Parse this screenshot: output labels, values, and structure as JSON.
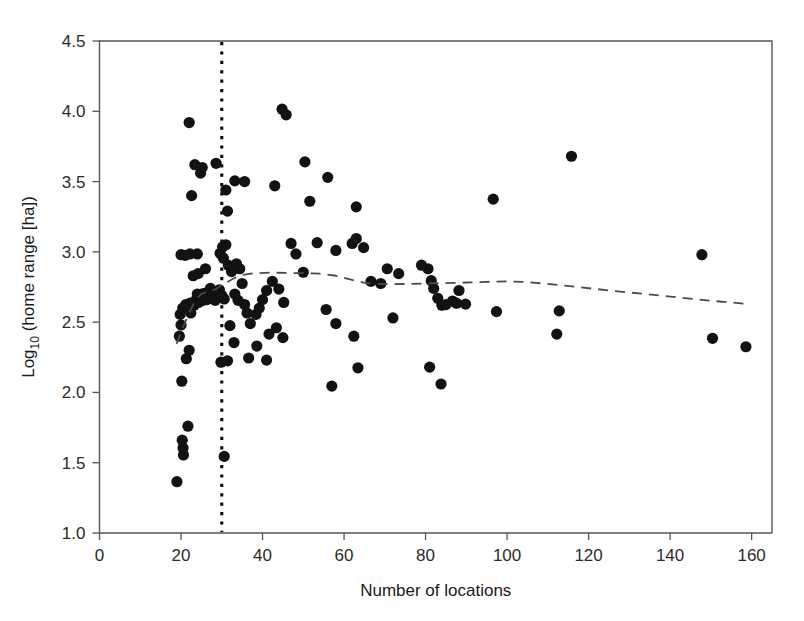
{
  "chart_data": {
    "type": "scatter",
    "title": "",
    "xlabel": "Number of locations",
    "ylabel_main": "Log",
    "ylabel_sub": "10",
    "ylabel_rest": " (home range [ha])",
    "ylabel_full": "Log10 (home range [ha])",
    "xlim": [
      0,
      165
    ],
    "ylim": [
      1.0,
      4.5
    ],
    "xticks": [
      0,
      20,
      40,
      60,
      80,
      100,
      120,
      140,
      160
    ],
    "xtick_labels": [
      "0",
      "20",
      "40",
      "60",
      "80",
      "100",
      "120",
      "140",
      "160"
    ],
    "yticks": [
      1.0,
      1.5,
      2.0,
      2.5,
      3.0,
      3.5,
      4.0,
      4.5
    ],
    "ytick_labels": [
      "1.0",
      "1.5",
      "2.0",
      "2.5",
      "3.0",
      "3.5",
      "4.0",
      "4.5"
    ],
    "grid": false,
    "legend": "none",
    "marker_color": "#121212",
    "marker_radius": 5.6,
    "annotations": [
      {
        "name": "threshold-line",
        "type": "vertical-dotted-line",
        "x": 30,
        "color": "#0d0d0d",
        "style": "dotted"
      },
      {
        "name": "trend-line",
        "type": "dashed-smoother",
        "color": "#4a4a4a",
        "style": "dashed"
      }
    ],
    "trend_points": [
      [
        18.9,
        2.345
      ],
      [
        20.0,
        2.425
      ],
      [
        21.0,
        2.5
      ],
      [
        22.0,
        2.565
      ],
      [
        23.0,
        2.625
      ],
      [
        24.0,
        2.672
      ],
      [
        25.0,
        2.7
      ],
      [
        26.0,
        2.712
      ],
      [
        27.0,
        2.718
      ],
      [
        28.5,
        2.735
      ],
      [
        30.0,
        2.762
      ],
      [
        31.5,
        2.788
      ],
      [
        33.0,
        2.812
      ],
      [
        35.0,
        2.835
      ],
      [
        38.0,
        2.848
      ],
      [
        42.0,
        2.852
      ],
      [
        46.0,
        2.85
      ],
      [
        50.0,
        2.848
      ],
      [
        54.0,
        2.845
      ],
      [
        58.0,
        2.83
      ],
      [
        62.0,
        2.8
      ],
      [
        65.0,
        2.78
      ],
      [
        68.0,
        2.772
      ],
      [
        72.0,
        2.77
      ],
      [
        76.0,
        2.772
      ],
      [
        80.0,
        2.775
      ],
      [
        85.0,
        2.778
      ],
      [
        90.0,
        2.782
      ],
      [
        95.0,
        2.787
      ],
      [
        100.0,
        2.79
      ],
      [
        105.0,
        2.785
      ],
      [
        110.0,
        2.772
      ],
      [
        118.0,
        2.748
      ],
      [
        126.0,
        2.722
      ],
      [
        134.0,
        2.7
      ],
      [
        142.0,
        2.676
      ],
      [
        150.0,
        2.652
      ],
      [
        158.0,
        2.632
      ]
    ],
    "points": [
      [
        19.0,
        1.365
      ],
      [
        20.5,
        1.605
      ],
      [
        20.3,
        1.66
      ],
      [
        21.7,
        1.76
      ],
      [
        20.6,
        1.555
      ],
      [
        30.6,
        1.545
      ],
      [
        20.2,
        2.08
      ],
      [
        21.3,
        2.24
      ],
      [
        22.0,
        2.3
      ],
      [
        19.6,
        2.4
      ],
      [
        20.0,
        2.48
      ],
      [
        19.8,
        2.555
      ],
      [
        20.4,
        2.6
      ],
      [
        21.2,
        2.625
      ],
      [
        22.2,
        2.635
      ],
      [
        22.4,
        2.565
      ],
      [
        23.2,
        2.62
      ],
      [
        23.6,
        2.655
      ],
      [
        24.0,
        2.7
      ],
      [
        24.3,
        2.64
      ],
      [
        25.0,
        2.7
      ],
      [
        25.4,
        2.655
      ],
      [
        25.8,
        2.705
      ],
      [
        26.4,
        2.66
      ],
      [
        26.8,
        2.695
      ],
      [
        27.2,
        2.74
      ],
      [
        27.8,
        2.69
      ],
      [
        28.4,
        2.655
      ],
      [
        28.8,
        2.7
      ],
      [
        29.4,
        2.73
      ],
      [
        30.0,
        2.69
      ],
      [
        30.6,
        2.665
      ],
      [
        23.0,
        2.83
      ],
      [
        24.2,
        2.845
      ],
      [
        26.0,
        2.88
      ],
      [
        29.6,
        2.99
      ],
      [
        30.2,
        3.035
      ],
      [
        30.4,
        2.955
      ],
      [
        31.0,
        3.05
      ],
      [
        31.6,
        2.905
      ],
      [
        32.4,
        2.86
      ],
      [
        33.6,
        2.915
      ],
      [
        34.4,
        2.88
      ],
      [
        35.0,
        2.775
      ],
      [
        33.2,
        2.7
      ],
      [
        34.0,
        2.655
      ],
      [
        35.6,
        2.625
      ],
      [
        36.2,
        2.565
      ],
      [
        37.0,
        2.49
      ],
      [
        32.0,
        2.475
      ],
      [
        33.0,
        2.355
      ],
      [
        31.4,
        2.225
      ],
      [
        29.8,
        2.215
      ],
      [
        36.6,
        2.245
      ],
      [
        38.4,
        2.555
      ],
      [
        39.2,
        2.6
      ],
      [
        40.0,
        2.66
      ],
      [
        41.0,
        2.725
      ],
      [
        42.4,
        2.79
      ],
      [
        44.0,
        2.735
      ],
      [
        45.2,
        2.64
      ],
      [
        43.4,
        2.46
      ],
      [
        41.6,
        2.415
      ],
      [
        45.0,
        2.39
      ],
      [
        38.6,
        2.33
      ],
      [
        41.0,
        2.23
      ],
      [
        22.2,
        2.985
      ],
      [
        24.0,
        2.985
      ],
      [
        20.0,
        2.98
      ],
      [
        21.0,
        2.975
      ],
      [
        22.6,
        3.4
      ],
      [
        24.8,
        3.56
      ],
      [
        25.2,
        3.6
      ],
      [
        23.4,
        3.62
      ],
      [
        22.0,
        3.92
      ],
      [
        28.6,
        3.63
      ],
      [
        31.0,
        3.44
      ],
      [
        33.2,
        3.505
      ],
      [
        35.6,
        3.5
      ],
      [
        31.4,
        3.29
      ],
      [
        44.8,
        4.015
      ],
      [
        45.8,
        3.975
      ],
      [
        43.0,
        3.47
      ],
      [
        50.4,
        3.64
      ],
      [
        56.0,
        3.53
      ],
      [
        51.6,
        3.36
      ],
      [
        63.0,
        3.32
      ],
      [
        47.0,
        3.06
      ],
      [
        48.2,
        2.985
      ],
      [
        53.4,
        3.065
      ],
      [
        58.0,
        3.01
      ],
      [
        62.0,
        3.06
      ],
      [
        63.0,
        3.095
      ],
      [
        64.8,
        3.03
      ],
      [
        50.0,
        2.855
      ],
      [
        55.6,
        2.59
      ],
      [
        58.0,
        2.49
      ],
      [
        62.4,
        2.4
      ],
      [
        57.0,
        2.045
      ],
      [
        63.4,
        2.175
      ],
      [
        66.6,
        2.79
      ],
      [
        69.0,
        2.775
      ],
      [
        70.6,
        2.88
      ],
      [
        73.4,
        2.845
      ],
      [
        72.0,
        2.53
      ],
      [
        79.0,
        2.905
      ],
      [
        80.6,
        2.88
      ],
      [
        81.4,
        2.795
      ],
      [
        82.0,
        2.74
      ],
      [
        83.0,
        2.67
      ],
      [
        84.0,
        2.62
      ],
      [
        85.0,
        2.625
      ],
      [
        86.6,
        2.65
      ],
      [
        87.6,
        2.635
      ],
      [
        88.2,
        2.725
      ],
      [
        81.0,
        2.18
      ],
      [
        83.8,
        2.06
      ],
      [
        89.8,
        2.628
      ],
      [
        96.6,
        3.375
      ],
      [
        97.4,
        2.575
      ],
      [
        112.2,
        2.415
      ],
      [
        112.8,
        2.58
      ],
      [
        115.8,
        3.68
      ],
      [
        147.8,
        2.98
      ],
      [
        150.4,
        2.385
      ],
      [
        158.6,
        2.325
      ]
    ]
  }
}
